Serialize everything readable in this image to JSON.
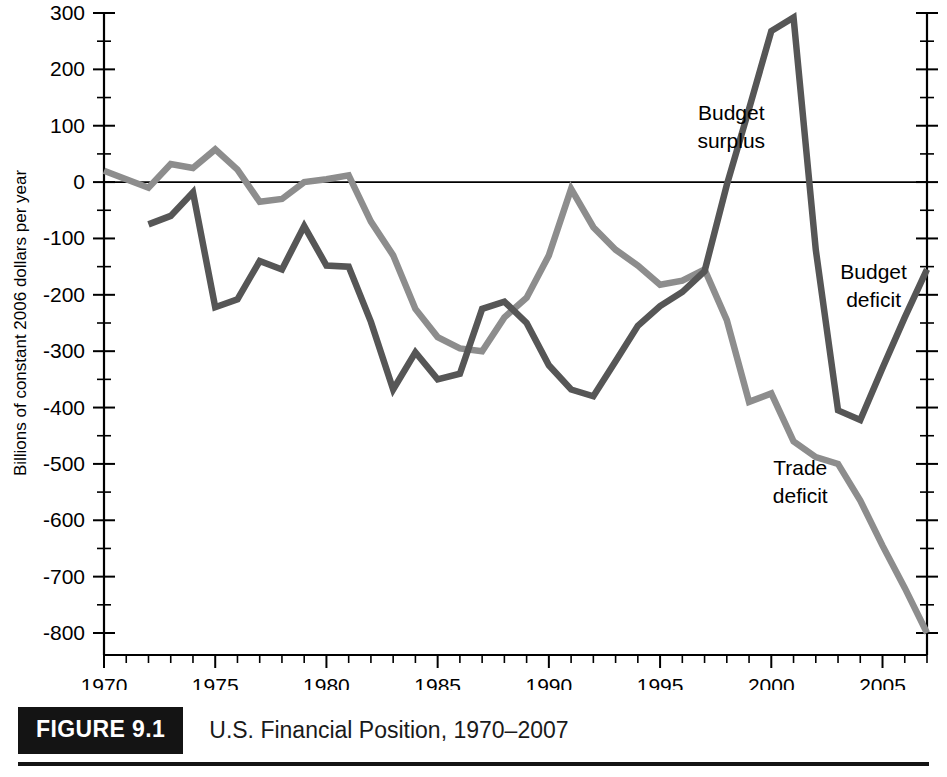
{
  "figure": {
    "badge_label": "FIGURE 9.1",
    "caption": "U.S. Financial Position, 1970–2007"
  },
  "chart_data": {
    "type": "line",
    "title": "U.S. Financial Position, 1970–2007",
    "xlabel": "",
    "ylabel": "Billions of constant 2006 dollars per year",
    "xlim": [
      1970,
      2007
    ],
    "ylim": [
      -800,
      300
    ],
    "grid": false,
    "legend_position": "inline-annotations",
    "y_ticks": [
      300,
      200,
      100,
      0,
      -100,
      -200,
      -300,
      -400,
      -500,
      -600,
      -700,
      -800
    ],
    "y_tick_labels": [
      "300",
      "200",
      "100",
      "0",
      "-100",
      "-200",
      "-300",
      "-400",
      "-500",
      "-600",
      "-700",
      "-800"
    ],
    "y_minor_step": 50,
    "x_ticks": [
      1970,
      1975,
      1980,
      1985,
      1990,
      1995,
      2000,
      2005
    ],
    "x_tick_labels": [
      "1970",
      "1975",
      "1980",
      "1985",
      "1990",
      "1995",
      "2000",
      "2005"
    ],
    "x_minor_step": 1,
    "annotations": [
      {
        "text_line1": "Budget",
        "text_line2": "surplus",
        "x": 1998.2,
        "y": 110
      },
      {
        "text_line1": "Budget",
        "text_line2": "deficit",
        "x": 2004.6,
        "y": -172
      },
      {
        "text_line1": "Trade",
        "text_line2": "deficit",
        "x": 2001.3,
        "y": -520
      }
    ],
    "series": [
      {
        "name": "Trade deficit",
        "color": "#8d8d8d",
        "x": [
          1970,
          1971,
          1972,
          1973,
          1974,
          1975,
          1976,
          1977,
          1978,
          1979,
          1980,
          1981,
          1982,
          1983,
          1984,
          1985,
          1986,
          1987,
          1988,
          1989,
          1990,
          1991,
          1992,
          1993,
          1994,
          1995,
          1996,
          1997,
          1998,
          1999,
          2000,
          2001,
          2002,
          2003,
          2004,
          2005,
          2006,
          2007
        ],
        "values": [
          20,
          5,
          -10,
          32,
          25,
          58,
          22,
          -35,
          -30,
          0,
          5,
          12,
          -70,
          -130,
          -225,
          -275,
          -295,
          -300,
          -240,
          -205,
          -130,
          -12,
          -80,
          -120,
          -148,
          -182,
          -175,
          -155,
          -245,
          -390,
          -375,
          -460,
          -488,
          -500,
          -565,
          -645,
          -720,
          -800
        ]
      },
      {
        "name": "Budget surplus/deficit",
        "color": "#565656",
        "x": [
          1972,
          1973,
          1974,
          1975,
          1976,
          1977,
          1978,
          1979,
          1980,
          1981,
          1982,
          1983,
          1984,
          1985,
          1986,
          1987,
          1988,
          1989,
          1990,
          1991,
          1992,
          1993,
          1994,
          1995,
          1996,
          1997,
          1998,
          1999,
          2000,
          2001,
          2002,
          2003,
          2004,
          2005,
          2006,
          2007
        ],
        "values": [
          -75,
          -60,
          -18,
          -222,
          -208,
          -140,
          -155,
          -78,
          -148,
          -150,
          -248,
          -368,
          -302,
          -350,
          -340,
          -225,
          -212,
          -250,
          -325,
          -368,
          -380,
          -318,
          -255,
          -220,
          -195,
          -158,
          -5,
          130,
          268,
          292,
          -120,
          -405,
          -422,
          -330,
          -240,
          -155
        ]
      }
    ]
  }
}
